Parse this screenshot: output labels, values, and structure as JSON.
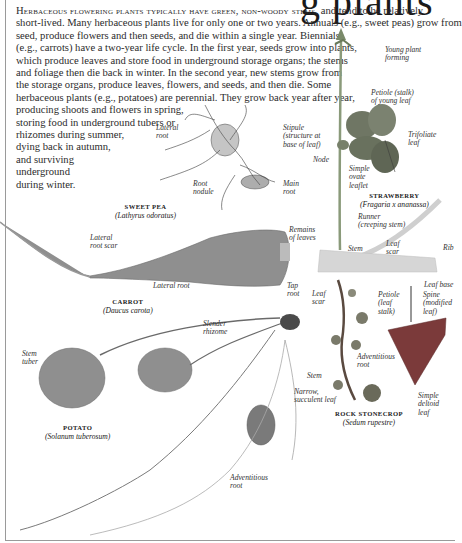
{
  "page": {
    "heading_fragment": "g plants",
    "intro": {
      "lead_small_caps": "Herbaceous flowering plants typically have green, non-woody stems,",
      "lines": [
        " and tend to be relatively",
        "short-lived. Many herbaceous plants live for only one or two years. Annuals (e.g., sweet peas) grow from",
        "seed, produce flowers and then seeds, and die within a single year. Biennials",
        "(e.g., carrots) have a two-year life cycle. In the first year, seeds grow into plants,",
        "which produce leaves and store food in underground storage organs; the stems",
        "and foliage then die back in winter. In the second year, new stems grow from",
        "the storage organs, produce leaves, flowers, and seeds, and then die. Some",
        "herbaceous plants (e.g., potatoes) are perennial. They grow back year after year,",
        "producing shoots and flowers in spring,",
        "storing food in underground tubers or",
        "rhizomes during summer,",
        "dying back in autumn,",
        "and surviving",
        "underground",
        "during winter."
      ]
    },
    "specimens": {
      "sweet_pea": {
        "common": "SWEET PEA",
        "latin": "(Lathyrus odoratus)",
        "labels": {
          "lateral_root": "Lateral\nroot",
          "root_nodule": "Root\nnodule",
          "main_root": "Main\nroot"
        }
      },
      "strawberry": {
        "common": "STRAWBERRY",
        "latin": "(Fragaria x ananassa)",
        "labels": {
          "young_plant": "Young plant\nforming",
          "petiole": "Petiole (stalk)\nof young leaf",
          "stipule": "Stipule\n(structure at\nbase of leaf)",
          "node": "Node",
          "trifoliate": "Trifoliate\nleaf",
          "simple_ovate": "Simple\novate\nleaflet",
          "runner": "Runner\n(creeping stem)"
        }
      },
      "carrot": {
        "common": "CARROT",
        "latin": "(Daucus carota)",
        "labels": {
          "lateral_root_scar": "Lateral\nroot scar",
          "remains_of_leaves": "Remains\nof leaves",
          "lateral_root": "Lateral root",
          "tap_root": "Tap\nroot"
        }
      },
      "rhubarb_fragment": {
        "labels": {
          "stem": "Stem",
          "leaf_scar": "Leaf\nscar",
          "rib": "Rib"
        }
      },
      "rock_stonecrop": {
        "common": "ROCK STONECROP",
        "latin": "(Sedum rupestre)",
        "labels": {
          "leaf_scar": "Leaf\nscar",
          "adventitious_root": "Adventitious\nroot",
          "stem": "Stem",
          "narrow_leaf": "Narrow,\nsucculent leaf"
        }
      },
      "leaf_specimen": {
        "labels": {
          "leaf_base": "Leaf base",
          "petiole": "Petiole\n(leaf\nstalk)",
          "spine": "Spine\n(modified\nleaf)",
          "simple_deltoid": "Simple\ndeltoid\nleaf"
        }
      },
      "potato": {
        "common": "POTATO",
        "latin": "(Solanum tuberosum)",
        "labels": {
          "stem_tuber": "Stem\ntuber",
          "slender_rhizome": "Slender\nrhizome",
          "adventitious_root": "Adventitious\nroot"
        }
      }
    }
  }
}
